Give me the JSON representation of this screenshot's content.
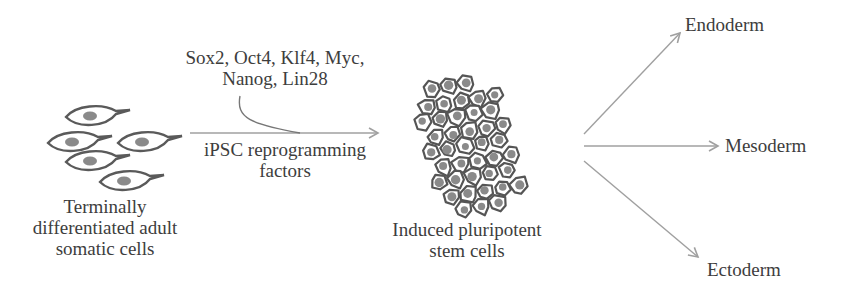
{
  "diagram": {
    "nodes": {
      "somatic": {
        "label_lines": [
          "Terminally",
          "differentiated adult",
          "somatic cells"
        ],
        "icon": "somatic-cells-icon"
      },
      "factors": {
        "label_lines": [
          "Sox2, Oct4, Klf4, Myc,",
          "Nanog, Lin28"
        ]
      },
      "process": {
        "label_lines": [
          "iPSC reprogramming",
          "factors"
        ]
      },
      "ipsc": {
        "label_lines": [
          "Induced pluripotent",
          "stem cells"
        ],
        "icon": "stem-cell-cluster-icon"
      },
      "endoderm": {
        "label": "Endoderm"
      },
      "mesoderm": {
        "label": "Mesoderm"
      },
      "ectoderm": {
        "label": "Ectoderm"
      }
    },
    "edges": [
      {
        "from": "somatic",
        "to": "ipsc",
        "label": "iPSC reprogramming factors"
      },
      {
        "from": "factors",
        "to": "somatic-ipsc-arrow",
        "style": "curved-connector"
      },
      {
        "from": "ipsc",
        "to": "endoderm"
      },
      {
        "from": "ipsc",
        "to": "mesoderm"
      },
      {
        "from": "ipsc",
        "to": "ectoderm"
      }
    ],
    "colors": {
      "arrow": "#a0a0a0",
      "cell_outline": "#5a5a5a",
      "nucleus": "#8a8a8a",
      "text": "#3d3d3d"
    }
  }
}
